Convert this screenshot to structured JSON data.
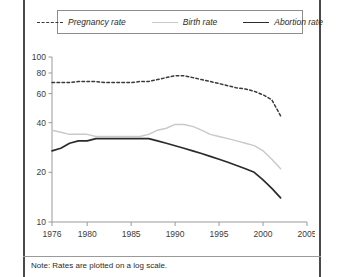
{
  "figure": {
    "footnote": "Note: Rates are plotted on a log scale."
  },
  "legend": {
    "position": "top-center",
    "items": [
      {
        "label": "Pregnancy rate",
        "style": "dotted",
        "color": "#3a3a3a",
        "icon": "dotted-line-icon"
      },
      {
        "label": "Birth rate",
        "style": "solid-light",
        "color": "#c9c9c9",
        "icon": "solid-line-icon"
      },
      {
        "label": "Abortion rate",
        "style": "solid-dark",
        "color": "#2b2b2b",
        "icon": "solid-line-icon"
      }
    ]
  },
  "chart_data": {
    "type": "line",
    "title": "",
    "subtitle": "",
    "xlabel": "",
    "ylabel": "",
    "yscale": "log",
    "ylim": [
      10,
      100
    ],
    "xlim": [
      1976,
      2005
    ],
    "grid": false,
    "legend_position": "top-center",
    "ytick_labels": [
      "100",
      "80",
      "60",
      "40",
      "20",
      "10"
    ],
    "yticks": [
      100,
      80,
      60,
      40,
      20,
      10
    ],
    "xtick_labels": [
      "1976",
      "1980",
      "1985",
      "1990",
      "1995",
      "2000",
      "2005"
    ],
    "xticks": [
      1976,
      1980,
      1985,
      1990,
      1995,
      2000,
      2005
    ],
    "annotations": [
      "Note: Rates are plotted on a log scale."
    ],
    "x": [
      1976,
      1977,
      1978,
      1979,
      1980,
      1981,
      1982,
      1983,
      1984,
      1985,
      1986,
      1987,
      1988,
      1989,
      1990,
      1991,
      1992,
      1993,
      1994,
      1995,
      1996,
      1997,
      1998,
      1999,
      2000,
      2001,
      2002
    ],
    "series": [
      {
        "name": "Pregnancy rate",
        "style": "dotted",
        "color": "#3a3a3a",
        "values": [
          70,
          70,
          70,
          71,
          71,
          71,
          70,
          70,
          70,
          70,
          71,
          71,
          73,
          75,
          77,
          77,
          75,
          73,
          71,
          69,
          67,
          65,
          64,
          62,
          59,
          55,
          44
        ]
      },
      {
        "name": "Birth rate",
        "style": "solid-light",
        "color": "#c9c9c9",
        "values": [
          36,
          35,
          34,
          34,
          34,
          33,
          33,
          33,
          33,
          33,
          33,
          34,
          36,
          37,
          39,
          39,
          38,
          36,
          34,
          33,
          32,
          31,
          30,
          29,
          27,
          24,
          21
        ]
      },
      {
        "name": "Abortion rate",
        "style": "solid-dark",
        "color": "#2b2b2b",
        "values": [
          27,
          28,
          30,
          31,
          31,
          32,
          32,
          32,
          32,
          32,
          32,
          32,
          31,
          30,
          29,
          28,
          27,
          26,
          25,
          24,
          23,
          22,
          21,
          20,
          18,
          16,
          14
        ]
      }
    ]
  }
}
